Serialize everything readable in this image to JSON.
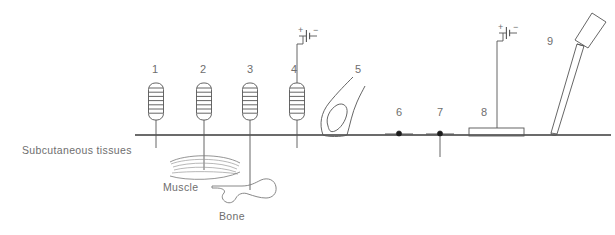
{
  "figure": {
    "type": "anatomical-cross-section-diagram",
    "title": "",
    "background_color": "#ffffff",
    "line_color": "#555555",
    "text_color": "#6e6e6e"
  },
  "tissue_labels": [
    {
      "id": "subcutaneous",
      "text": "Subcutaneous tissues",
      "x": 22,
      "y": 145
    },
    {
      "id": "muscle",
      "text": "Muscle",
      "x": 163,
      "y": 182
    },
    {
      "id": "bone",
      "text": "Bone",
      "x": 219,
      "y": 211
    }
  ],
  "skin_line": {
    "label": "skin-surface-line",
    "x1": 135,
    "x2": 611,
    "y": 135
  },
  "items": [
    {
      "number": "1",
      "name": "coil-electrode-1",
      "kind": "coil",
      "number_x": 153,
      "number_y": 64,
      "x": 156,
      "coil_top": 83,
      "coil_bottom": 120,
      "lead_bottom": 148,
      "battery": false
    },
    {
      "number": "2",
      "name": "coil-electrode-2",
      "kind": "coil",
      "number_x": 202,
      "number_y": 64,
      "x": 204,
      "coil_top": 83,
      "coil_bottom": 120,
      "lead_bottom": 170,
      "battery": false
    },
    {
      "number": "3",
      "name": "coil-electrode-3",
      "kind": "coil",
      "number_x": 249,
      "number_y": 64,
      "x": 250,
      "coil_top": 83,
      "coil_bottom": 120,
      "lead_bottom": 192,
      "battery": false
    },
    {
      "number": "4",
      "name": "coil-electrode-4",
      "kind": "coil",
      "number_x": 294,
      "number_y": 64,
      "x": 297,
      "coil_top": 83,
      "coil_bottom": 120,
      "lead_bottom": 148,
      "battery": true,
      "battery_x": 303,
      "battery_y": 36,
      "plus": "+",
      "minus": "−"
    },
    {
      "number": "5",
      "name": "fingertip-probe",
      "kind": "finger",
      "number_x": 357,
      "number_y": 64
    },
    {
      "number": "6",
      "name": "surface-dot-electrode-6",
      "kind": "dot",
      "number_x": 397,
      "number_y": 109,
      "x": 399,
      "y": 135,
      "penetrates": false
    },
    {
      "number": "7",
      "name": "surface-dot-electrode-7",
      "kind": "dot",
      "number_x": 438,
      "number_y": 109,
      "x": 440,
      "y": 135,
      "penetrates": true,
      "lead_bottom": 155
    },
    {
      "number": "8",
      "name": "plate-electrode",
      "kind": "plate",
      "number_x": 483,
      "number_y": 109,
      "x": 497,
      "plate_left": 469,
      "plate_right": 524,
      "plate_top": 128,
      "plate_bottom": 136,
      "lead_top": 40,
      "battery": true,
      "battery_x": 503,
      "battery_y": 33,
      "plus": "+",
      "minus": "−"
    },
    {
      "number": "9",
      "name": "needle-instrument",
      "kind": "needle",
      "number_x": 549,
      "number_y": 38,
      "tip_x": 553,
      "tip_y": 134,
      "hub_x": 589,
      "hub_y": 18
    }
  ],
  "muscle_shape": {
    "name": "muscle-fusiform",
    "cx": 204,
    "cy": 168
  },
  "bone_shape": {
    "name": "bone-end",
    "cx": 250,
    "cy": 192
  }
}
